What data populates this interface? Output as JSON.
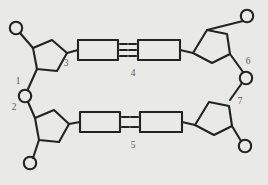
{
  "diagram": {
    "background_color": "#e9e9e7",
    "stroke_color": "#232323",
    "label_color": "#5c5c5a",
    "labels": [
      {
        "id": "1",
        "text": "1",
        "meaning": "phosphate-group",
        "x": 18,
        "y": 84
      },
      {
        "id": "2",
        "text": "2",
        "meaning": "phosphodiester-bond",
        "x": 14,
        "y": 110
      },
      {
        "id": "3",
        "text": "3",
        "meaning": "glycosidic-bond",
        "x": 66,
        "y": 66
      },
      {
        "id": "4",
        "text": "4",
        "meaning": "hydrogen-bonds-triple",
        "x": 133,
        "y": 76
      },
      {
        "id": "5",
        "text": "5",
        "meaning": "hydrogen-bonds-double",
        "x": 133,
        "y": 148
      },
      {
        "id": "6",
        "text": "6",
        "meaning": "deoxyribose-sugar",
        "x": 248,
        "y": 64
      },
      {
        "id": "7",
        "text": "7",
        "meaning": "nucleotide",
        "x": 240,
        "y": 104
      }
    ],
    "base_pairs": [
      {
        "name": "top-base-pair",
        "bond_count": 3,
        "label_ref": "4"
      },
      {
        "name": "bottom-base-pair",
        "bond_count": 2,
        "label_ref": "5"
      }
    ],
    "strands": [
      {
        "name": "upper-strand",
        "phosphates": 2,
        "sugars": 2,
        "bases": 2
      },
      {
        "name": "lower-strand",
        "phosphates": 2,
        "sugars": 2,
        "bases": 2
      }
    ]
  }
}
